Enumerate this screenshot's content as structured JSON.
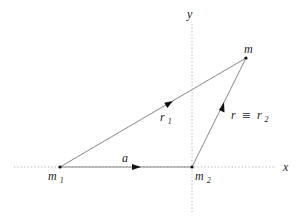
{
  "diagram": {
    "type": "vector-diagram",
    "axes": {
      "x_label": "x",
      "y_label": "y",
      "style": "dotted"
    },
    "points": {
      "m1": {
        "label": "m",
        "subscript": "1"
      },
      "m2": {
        "label": "m",
        "subscript": "2"
      },
      "m": {
        "label": "m"
      }
    },
    "vectors": {
      "a": {
        "label": "a",
        "from": "m1",
        "to": "m2"
      },
      "r1": {
        "label": "r",
        "subscript": "1",
        "from": "m1",
        "to": "m"
      },
      "r2": {
        "label_left": "r",
        "equiv": "≡",
        "label_right": "r",
        "subscript": "2",
        "from": "m2",
        "to": "m"
      }
    },
    "colors": {
      "background": "#ffffff",
      "vector_line": "#7a7a7a",
      "axis_line": "#9a9a9a",
      "arrowhead": "#111111",
      "text": "#222222"
    }
  }
}
